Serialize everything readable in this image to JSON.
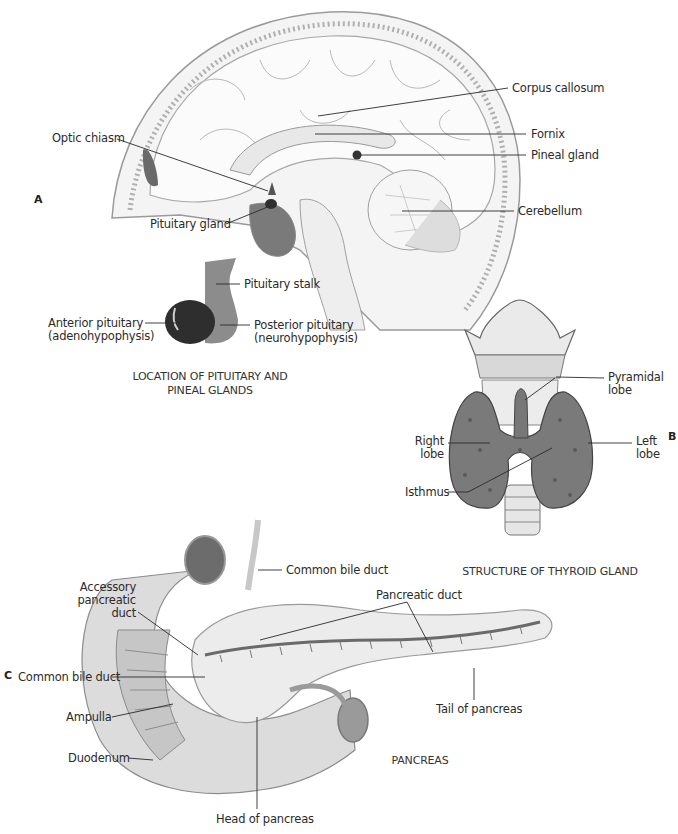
{
  "figure": {
    "panels": [
      {
        "id": "A",
        "letter": "A",
        "caption_line1": "LOCATION OF PITUITARY AND",
        "caption_line2": "PINEAL GLANDS",
        "labels": {
          "corpus_callosum": "Corpus callosum",
          "fornix": "Fornix",
          "pineal_gland": "Pineal gland",
          "optic_chiasm": "Optic chiasm",
          "pituitary_gland": "Pituitary gland",
          "cerebellum": "Cerebellum",
          "pituitary_stalk": "Pituitary stalk",
          "anterior_pituitary_1": "Anterior pituitary",
          "anterior_pituitary_2": "(adenohypophysis)",
          "posterior_pituitary_1": "Posterior pituitary",
          "posterior_pituitary_2": "(neurohypophysis)"
        }
      },
      {
        "id": "B",
        "letter": "B",
        "caption": "STRUCTURE OF THYROID GLAND",
        "labels": {
          "pyramidal_lobe_1": "Pyramidal",
          "pyramidal_lobe_2": "lobe",
          "right_lobe_1": "Right",
          "right_lobe_2": "lobe",
          "left_lobe_1": "Left",
          "left_lobe_2": "lobe",
          "isthmus": "Isthmus"
        }
      },
      {
        "id": "C",
        "letter": "C",
        "caption": "PANCREAS",
        "labels": {
          "common_bile_duct_top": "Common bile duct",
          "accessory_duct_1": "Accessory",
          "accessory_duct_2": "pancreatic",
          "accessory_duct_3": "duct",
          "pancreatic_duct": "Pancreatic duct",
          "common_bile_duct_left": "Common bile duct",
          "ampulla": "Ampulla",
          "duodenum": "Duodenum",
          "tail_of_pancreas": "Tail of pancreas",
          "head_of_pancreas": "Head of pancreas"
        }
      }
    ],
    "colors": {
      "line": "#2a2a2a",
      "outline": "#8a8a8a",
      "fill_light": "#efefef",
      "fill_mid": "#bdbdbd",
      "fill_dark": "#555555",
      "thyroid": "#7a7a7a"
    }
  }
}
